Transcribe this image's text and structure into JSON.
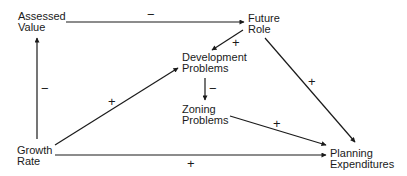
{
  "diagram": {
    "type": "causal-loop",
    "nodes": {
      "assessed_value": {
        "line1": "Assessed",
        "line2": "Value"
      },
      "future_role": {
        "line1": "Future",
        "line2": "Role"
      },
      "development_problems": {
        "line1": "Development",
        "line2": "Problems"
      },
      "zoning_problems": {
        "line1": "Zoning",
        "line2": "Problems"
      },
      "growth_rate": {
        "line1": "Growth",
        "line2": "Rate"
      },
      "planning_expenditures": {
        "line1": "Planning",
        "line2": "Expenditures"
      }
    },
    "edges": [
      {
        "from": "Assessed Value",
        "to": "Future Role",
        "sign": "−"
      },
      {
        "from": "Growth Rate",
        "to": "Assessed Value",
        "sign": "−"
      },
      {
        "from": "Future Role",
        "to": "Development Problems",
        "sign": "+"
      },
      {
        "from": "Development Problems",
        "to": "Zoning Problems",
        "sign": "−"
      },
      {
        "from": "Growth Rate",
        "to": "Development Problems",
        "sign": "+"
      },
      {
        "from": "Future Role",
        "to": "Planning Expenditures",
        "sign": "+"
      },
      {
        "from": "Zoning Problems",
        "to": "Planning Expenditures",
        "sign": "+"
      },
      {
        "from": "Growth Rate",
        "to": "Planning Expenditures",
        "sign": "+"
      }
    ],
    "colors": {
      "line": "#1a1a1a",
      "background": "#ffffff"
    }
  }
}
